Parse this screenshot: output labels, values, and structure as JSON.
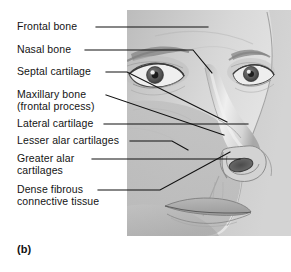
{
  "figure": {
    "caption": "(b)",
    "colors": {
      "ink": "#141414",
      "leader_line": "#111111",
      "plate_background": "#c9c9c9",
      "skin_light": "#e6e6e6",
      "skin_mid": "#c2c2c2",
      "skin_dark": "#9a9a9a",
      "shadow": "#7d7d7d",
      "page_background": "#ffffff"
    }
  },
  "labels": [
    {
      "id": "frontal-bone",
      "line1": "Frontal bone",
      "line2": ""
    },
    {
      "id": "nasal-bone",
      "line1": "Nasal bone",
      "line2": ""
    },
    {
      "id": "septal-cartilage",
      "line1": "Septal cartilage",
      "line2": ""
    },
    {
      "id": "maxillary-bone",
      "line1": "Maxillary bone",
      "line2": "(frontal process)"
    },
    {
      "id": "lateral-cartilage",
      "line1": "Lateral cartilage",
      "line2": ""
    },
    {
      "id": "lesser-alar-cartilages",
      "line1": "Lesser alar cartilages",
      "line2": ""
    },
    {
      "id": "greater-alar-cartilages",
      "line1": "Greater alar",
      "line2": "cartilages"
    },
    {
      "id": "dense-fibrous-connective-tissue",
      "line1": "Dense fibrous",
      "line2": "connective tissue"
    }
  ]
}
